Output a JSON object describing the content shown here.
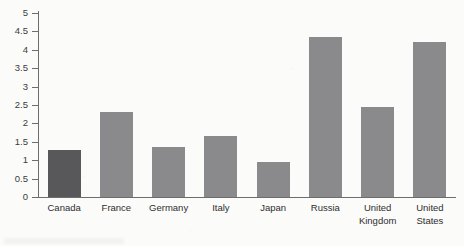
{
  "chart_data": {
    "type": "bar",
    "title": "",
    "xlabel": "",
    "ylabel": "",
    "categories": [
      "Canada",
      "France",
      "Germany",
      "Italy",
      "Japan",
      "Russia",
      "United Kingdom",
      "United States"
    ],
    "values": [
      1.28,
      2.3,
      1.37,
      1.65,
      0.95,
      4.35,
      2.45,
      4.2
    ],
    "ylim": [
      0,
      5
    ],
    "ytick_labels": [
      "0",
      "0.5",
      "1",
      "1.5",
      "2",
      "2.5",
      "3",
      "3.5",
      "4",
      "4.5",
      "5"
    ],
    "ytick_values": [
      0,
      0.5,
      1,
      1.5,
      2,
      2.5,
      3,
      3.5,
      4,
      4.5,
      5
    ],
    "grid": false,
    "legend": false,
    "bar_color": "#8a8a8c",
    "highlight_color": "#58585a",
    "highlight_category": "Canada",
    "axis_color": "#6d6d6d",
    "background": "#fbfbf9"
  },
  "category_label_lines": [
    [
      "Canada"
    ],
    [
      "France"
    ],
    [
      "Germany"
    ],
    [
      "Italy"
    ],
    [
      "Japan"
    ],
    [
      "Russia"
    ],
    [
      "United",
      "Kingdom"
    ],
    [
      "United",
      "States"
    ]
  ]
}
